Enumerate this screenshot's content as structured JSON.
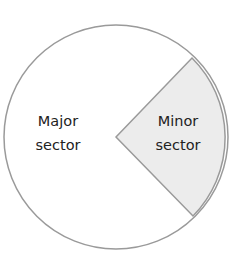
{
  "diagram": {
    "title": "",
    "shape": "circle",
    "colors": {
      "outline": "#9a9a9a",
      "major_fill": "#ffffff",
      "minor_fill": "#ececec",
      "text": "#222222"
    },
    "sectors": [
      {
        "name": "major",
        "line1": "Major",
        "line2": "sector"
      },
      {
        "name": "minor",
        "line1": "Minor",
        "line2": "sector"
      }
    ]
  }
}
